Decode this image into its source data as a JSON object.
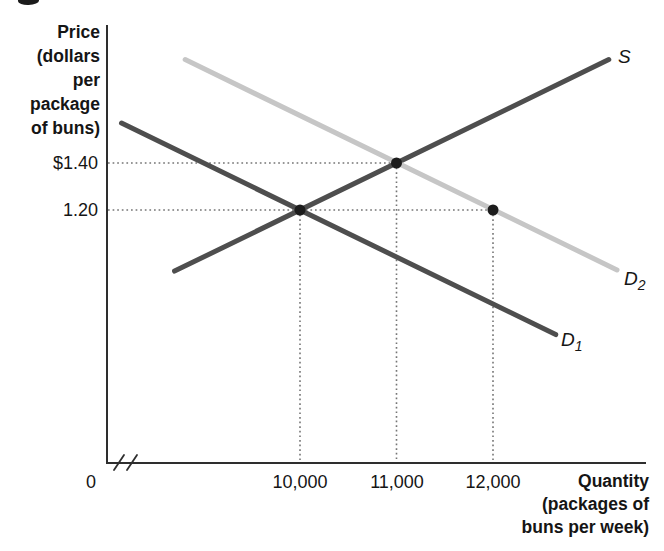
{
  "chart_data": {
    "type": "line",
    "title": "",
    "ylabel": "Price\n(dollars\nper\npackage\nof buns)",
    "xlabel": "Quantity\n(packages of\nbuns per week)",
    "x_axis": {
      "origin_label": "0",
      "has_break": true,
      "range_visible": [
        8000,
        13600
      ],
      "ticks": [
        {
          "value": 10000,
          "label": "10,000"
        },
        {
          "value": 11000,
          "label": "11,000"
        },
        {
          "value": 12000,
          "label": "12,000"
        }
      ]
    },
    "y_axis": {
      "range_visible": [
        0.13,
        1.99
      ],
      "ticks": [
        {
          "value": 1.4,
          "label": "$1.40"
        },
        {
          "value": 1.2,
          "label": "1.20"
        }
      ]
    },
    "grid": "off",
    "legend": "inline-curve-labels",
    "series": [
      {
        "name": "S",
        "kind": "supply",
        "color": "#4e4e4e",
        "width": 5,
        "points": [
          [
            8700,
            0.94
          ],
          [
            13200,
            1.84
          ]
        ],
        "label": {
          "base": "S",
          "sub": ""
        }
      },
      {
        "name": "D1",
        "kind": "demand-original",
        "color": "#4e4e4e",
        "width": 5,
        "points": [
          [
            8150,
            1.57
          ],
          [
            12650,
            0.67
          ]
        ],
        "label": {
          "base": "D",
          "sub": "1"
        }
      },
      {
        "name": "D2",
        "kind": "demand-shifted",
        "color": "#c6c6c6",
        "width": 5,
        "points": [
          [
            8810,
            1.84
          ],
          [
            13285,
            0.945
          ]
        ],
        "label": {
          "base": "D",
          "sub": "2"
        }
      }
    ],
    "markers": [
      {
        "x": 10000,
        "y": 1.2,
        "desc": "equilibrium-S-D1"
      },
      {
        "x": 11000,
        "y": 1.4,
        "desc": "equilibrium-S-D2"
      },
      {
        "x": 12000,
        "y": 1.2,
        "desc": "quantity-demanded-on-D2-at-1.20"
      }
    ],
    "guides": [
      {
        "type": "h",
        "price": 1.4,
        "to_q": 11000
      },
      {
        "type": "h",
        "price": 1.2,
        "to_q": 12000
      },
      {
        "type": "v",
        "q": 10000,
        "from_p": 1.2
      },
      {
        "type": "v",
        "q": 11000,
        "from_p": 1.4
      },
      {
        "type": "v",
        "q": 12000,
        "from_p": 1.2
      }
    ],
    "colors": {
      "axis": "#2e2e2e",
      "dot": "#1c1c1c",
      "guide": "#757575",
      "text": "#151515",
      "background": "#ffffff"
    }
  }
}
